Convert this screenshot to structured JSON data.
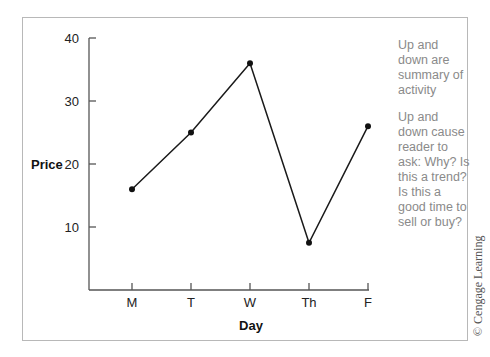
{
  "chart_data": {
    "type": "line",
    "title": "",
    "xlabel": "Day",
    "ylabel": "Price",
    "categories": [
      "M",
      "T",
      "W",
      "Th",
      "F"
    ],
    "values": [
      16,
      25,
      36,
      7.5,
      26
    ],
    "yticks": [
      10,
      20,
      30,
      40
    ],
    "ytick_labels": [
      "10",
      "20",
      "30",
      "40"
    ],
    "ylim": [
      0,
      40
    ],
    "grid": false,
    "legend": "none",
    "annotations": [
      "Up and down are summary of activity",
      "Up and down cause reader to ask: Why? Is this a trend? Is this a good time to sell or buy?"
    ]
  },
  "notes": {
    "note1": "Up and down are summary of activity",
    "note2": "Up and down cause reader to ask: Why? Is this a trend? Is this a good time to sell or buy?"
  },
  "copyright": "© Cengage Learning"
}
